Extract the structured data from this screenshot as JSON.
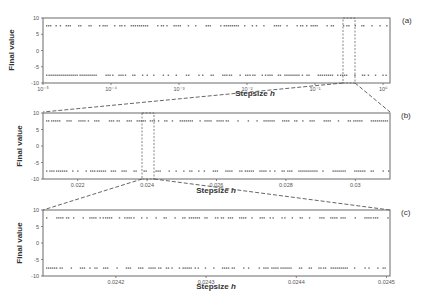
{
  "chart_data": [
    {
      "panel": "(a)",
      "type": "scatter",
      "xlabel": "Stepsize h",
      "ylabel": "Final value",
      "xscale": "log",
      "xticks": [
        "10⁻⁵",
        "10⁻⁴",
        "10⁻³",
        "10⁻²",
        "10⁻¹",
        "10⁰"
      ],
      "yticks": [
        "10",
        "5",
        "0",
        "-5",
        "-10"
      ],
      "ylim": [
        -10,
        10
      ],
      "series": [
        {
          "name": "upper branch",
          "y": 7.6
        },
        {
          "name": "lower branch",
          "y": -7.6
        }
      ],
      "zoom_region": "dashed box near 10⁻¹ leading to panel (b)"
    },
    {
      "panel": "(b)",
      "type": "scatter",
      "xlabel": "Stepsize h",
      "ylabel": "Final value",
      "xlim": [
        0.021,
        0.031
      ],
      "xticks": [
        "0.022",
        "0.024",
        "0.026",
        "0.028",
        "0.03"
      ],
      "yticks": [
        "10",
        "5",
        "0",
        "-5",
        "-10"
      ],
      "ylim": [
        -10,
        10
      ],
      "series": [
        {
          "name": "upper branch",
          "y": 7.6
        },
        {
          "name": "lower branch",
          "y": -7.6
        }
      ],
      "zoom_region": "dashed box near 0.024 leading to panel (c)"
    },
    {
      "panel": "(c)",
      "type": "scatter",
      "xlabel": "Stepsize h",
      "ylabel": "Final value",
      "xlim": [
        0.02412,
        0.0245
      ],
      "xticks": [
        "0.0242",
        "0.0243",
        "0.0244",
        "0.0245"
      ],
      "yticks": [
        "10",
        "5",
        "0",
        "-5",
        "-10"
      ],
      "ylim": [
        -10,
        10
      ],
      "series": [
        {
          "name": "upper branch",
          "y": 7.6
        },
        {
          "name": "lower branch",
          "y": -7.6
        }
      ]
    }
  ],
  "panels": {
    "a": {
      "label": "(a)",
      "xlabel": "Stepsize",
      "xlabel_var": "h",
      "ylabel": "Final value",
      "xticks": [
        "10⁻⁵",
        "10⁻⁴",
        "10⁻³",
        "10⁻²",
        "10⁻¹",
        "10⁰"
      ]
    },
    "b": {
      "label": "(b)",
      "xlabel": "Stepsize",
      "xlabel_var": "h",
      "ylabel": "Final value",
      "xticks": [
        "0.022",
        "0.024",
        "0.026",
        "0.028",
        "0.03"
      ]
    },
    "c": {
      "label": "(c)",
      "xlabel": "Stepsize",
      "xlabel_var": "h",
      "ylabel": "Final value",
      "xticks": [
        "0.0242",
        "0.0243",
        "0.0244",
        "0.0245"
      ]
    }
  },
  "yticks": [
    "10",
    "5",
    "0",
    "-5",
    "-10"
  ],
  "colors": {
    "dots": "#555555",
    "frame": "#6a6a6a"
  }
}
